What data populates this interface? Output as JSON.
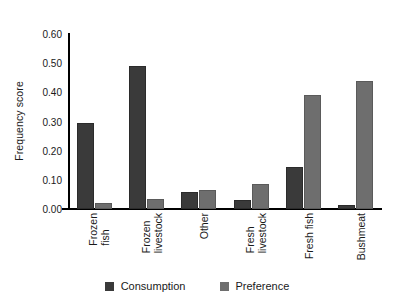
{
  "chart_data": {
    "type": "bar",
    "title": "",
    "xlabel": "",
    "ylabel": "Frequency score",
    "ylim": [
      0.0,
      0.6
    ],
    "ytick_labels": [
      "0.00",
      "0.10",
      "0.20",
      "0.30",
      "0.40",
      "0.50",
      "0.60"
    ],
    "ytick_values": [
      0.0,
      0.1,
      0.2,
      0.3,
      0.4,
      0.5,
      0.6
    ],
    "grid": false,
    "legend_position": "bottom-center",
    "categories": [
      "Frozen fish",
      "Frozen livestock",
      "Other",
      "Fresh livestock",
      "Fresh fish",
      "Bushmeat"
    ],
    "category_lines": [
      [
        "Frozen",
        "fish"
      ],
      [
        "Frozen",
        "livestock"
      ],
      [
        "Other"
      ],
      [
        "Fresh",
        "livestock"
      ],
      [
        "Fresh fish"
      ],
      [
        "Bushmeat"
      ]
    ],
    "series": [
      {
        "name": "Consumption",
        "color": "#3a3a3a",
        "values": [
          0.295,
          0.49,
          0.06,
          0.03,
          0.145,
          0.015
        ]
      },
      {
        "name": "Preference",
        "color": "#6e6e6e",
        "values": [
          0.022,
          0.036,
          0.066,
          0.085,
          0.39,
          0.44
        ]
      }
    ]
  },
  "legend": {
    "items": [
      {
        "label": "Consumption",
        "color": "#3a3a3a"
      },
      {
        "label": "Preference",
        "color": "#6e6e6e"
      }
    ]
  },
  "colors": {
    "consumption": "#3a3a3a",
    "preference": "#6e6e6e",
    "axis": "#000000",
    "text": "#1a1a1a",
    "background": "#ffffff"
  }
}
